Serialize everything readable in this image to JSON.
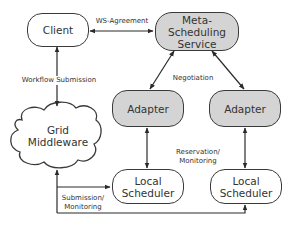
{
  "diagram": {
    "nodes": {
      "client": {
        "label": "Client",
        "style": "white"
      },
      "meta_scheduling_service": {
        "label": "Meta-\nScheduling\nService",
        "style": "shaded"
      },
      "adapter_left": {
        "label": "Adapter",
        "style": "shaded"
      },
      "adapter_right": {
        "label": "Adapter",
        "style": "shaded"
      },
      "grid_middleware": {
        "label": "Grid\nMiddleware",
        "shape": "cloud"
      },
      "local_scheduler_left": {
        "label": "Local\nScheduler",
        "style": "white"
      },
      "local_scheduler_right": {
        "label": "Local\nScheduler",
        "style": "white"
      }
    },
    "edges": [
      {
        "from": "client",
        "to": "meta_scheduling_service",
        "label": "WS-Agreement",
        "direction": "both"
      },
      {
        "from": "client",
        "to": "grid_middleware",
        "label": "Workflow Submission",
        "direction": "both"
      },
      {
        "from": "meta_scheduling_service",
        "to": "adapter_left",
        "label": "Negotiation",
        "direction": "both"
      },
      {
        "from": "meta_scheduling_service",
        "to": "adapter_right",
        "label": "Negotiation",
        "direction": "both"
      },
      {
        "from": "adapter_left",
        "to": "local_scheduler_left",
        "label": "Reservation/\nMonitoring",
        "direction": "both"
      },
      {
        "from": "adapter_right",
        "to": "local_scheduler_right",
        "label": "Reservation/\nMonitoring",
        "direction": "both"
      },
      {
        "from": "grid_middleware",
        "to": "local_scheduler_left",
        "label": "Submission/\nMonitoring",
        "direction": "both"
      },
      {
        "from": "grid_middleware",
        "to": "local_scheduler_right",
        "label": "Submission/\nMonitoring",
        "direction": "both"
      }
    ],
    "edge_labels": {
      "ws_agreement": "WS-Agreement",
      "workflow_submission": "Workflow Submission",
      "negotiation": "Negotiation",
      "reservation_monitoring": "Reservation/\nMonitoring",
      "submission_monitoring": "Submission/\nMonitoring"
    },
    "colors": {
      "shaded_fill": "#d4d4d4",
      "stroke": "#3a3a3a",
      "text": "#333333"
    }
  }
}
